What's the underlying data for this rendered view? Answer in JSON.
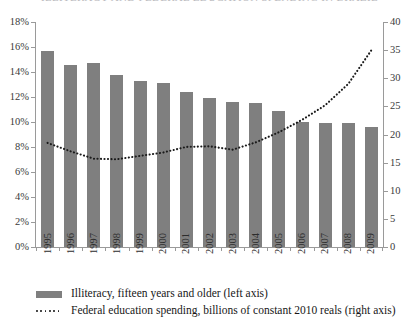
{
  "title": {
    "text": "ILLITERACY AND FEDERAL EDUCATION SPENDING IN BRAZIL",
    "cropped": true
  },
  "legend": {
    "position": "bottom-left",
    "entries": [
      {
        "marker": "bar-swatch",
        "label": "Illiteracy, fifteen years and older (left axis)"
      },
      {
        "marker": "dotted-line-swatch",
        "label": "Federal education spending, billions of constant 2010 reals (right axis)"
      }
    ]
  },
  "axes": {
    "left": {
      "ticks": [
        "0%",
        "2%",
        "4%",
        "6%",
        "8%",
        "10%",
        "12%",
        "14%",
        "16%",
        "18%"
      ],
      "min": 0,
      "max": 18
    },
    "right": {
      "ticks": [
        "0",
        "5",
        "10",
        "15",
        "20",
        "25",
        "30",
        "35",
        "40"
      ],
      "min": 0,
      "max": 40
    },
    "x": {
      "ticks": [
        "1995",
        "1996",
        "1997",
        "1998",
        "1999",
        "2000",
        "2001",
        "2002",
        "2003",
        "2004",
        "2005",
        "2006",
        "2007",
        "2008",
        "2009"
      ]
    }
  },
  "colors": {
    "bar": "#7f7f7f",
    "line": "#1b1b1b",
    "axis": "#9a9a9a",
    "text": "#1b1b1b"
  },
  "chart_data": {
    "type": "bar",
    "title": "Illiteracy and federal education spending in Brazil",
    "xlabel": "",
    "ylabel": "Illiteracy, fifteen years and older",
    "y2label": "Federal education spending, billions of constant 2010 reals",
    "ylim": [
      0,
      18
    ],
    "y2lim": [
      0,
      40
    ],
    "grid": false,
    "legend_position": "bottom-left",
    "categories": [
      "1995",
      "1996",
      "1997",
      "1998",
      "1999",
      "2000",
      "2001",
      "2002",
      "2003",
      "2004",
      "2005",
      "2006",
      "2007",
      "2008",
      "2009"
    ],
    "series": [
      {
        "name": "Illiteracy, fifteen years and older (left axis)",
        "type": "bar",
        "axis": "left",
        "unit": "%",
        "values": [
          15.7,
          14.6,
          14.7,
          13.8,
          13.3,
          13.1,
          12.4,
          11.9,
          11.6,
          11.5,
          10.9,
          10.0,
          9.9,
          9.9,
          9.6
        ]
      },
      {
        "name": "Federal education spending, billions of constant 2010 reals (right axis)",
        "type": "line",
        "style": "dotted",
        "axis": "right",
        "unit": "billions of 2010 reals",
        "values": [
          18.5,
          17.0,
          15.7,
          15.6,
          16.2,
          16.8,
          17.8,
          17.9,
          17.3,
          18.6,
          20.4,
          22.6,
          25.2,
          29.0,
          35.0
        ]
      }
    ]
  }
}
